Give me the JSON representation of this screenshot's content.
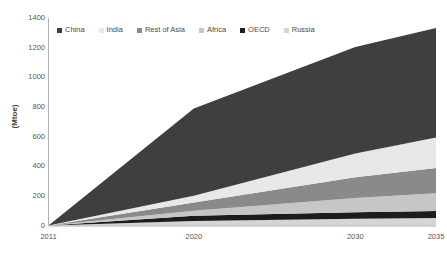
{
  "chart_data": {
    "type": "area",
    "stacked": true,
    "title": "",
    "subtitle": "",
    "xlabel": "",
    "ylabel": "(Mtoe)",
    "x": [
      2011,
      2020,
      2030,
      2035
    ],
    "xlim": [
      2011,
      2035
    ],
    "ylim": [
      0,
      1400
    ],
    "ytick_values": [
      0,
      200,
      400,
      600,
      800,
      1000,
      1200,
      1400
    ],
    "ytick_labels": [
      "0",
      "200",
      "400",
      "600",
      "800",
      "1000",
      "1200",
      "1400"
    ],
    "xtick_values": [
      2011,
      2020,
      2030,
      2035
    ],
    "xtick_labels": [
      "2011",
      "2020",
      "2030",
      "2035"
    ],
    "grid": false,
    "legend_position": "top-left-inside",
    "stack_order_bottom_to_top": [
      "Russia",
      "OECD",
      "Africa",
      "Rest of Asia",
      "India",
      "China"
    ],
    "series": [
      {
        "name": "China",
        "color": "#3f3f3f",
        "values": [
          0,
          590,
          720,
          740
        ]
      },
      {
        "name": "India",
        "color": "#e8e8e8",
        "values": [
          0,
          45,
          160,
          205
        ]
      },
      {
        "name": "Rest of Asia",
        "color": "#8a8a8a",
        "values": [
          0,
          55,
          140,
          170
        ]
      },
      {
        "name": "Africa",
        "color": "#c6c6c6",
        "values": [
          0,
          35,
          95,
          120
        ]
      },
      {
        "name": "OECD",
        "color": "#1c1c1c",
        "values": [
          0,
          35,
          45,
          48
        ]
      },
      {
        "name": "Russia",
        "color": "#d5d5d5",
        "values": [
          0,
          30,
          45,
          50
        ]
      }
    ],
    "totals": [
      0,
      790,
      1205,
      1333
    ],
    "legend": [
      {
        "label": "China",
        "color": "#3f3f3f"
      },
      {
        "label": "India",
        "color": "#e8e8e8"
      },
      {
        "label": "Rest of Asia",
        "color": "#8a8a8a"
      },
      {
        "label": "Africa",
        "color": "#c6c6c6"
      },
      {
        "label": "OECD",
        "color": "#1c1c1c"
      },
      {
        "label": "Russia",
        "color": "#d5d5d5"
      }
    ],
    "axis_color": "#b0b0b0"
  }
}
